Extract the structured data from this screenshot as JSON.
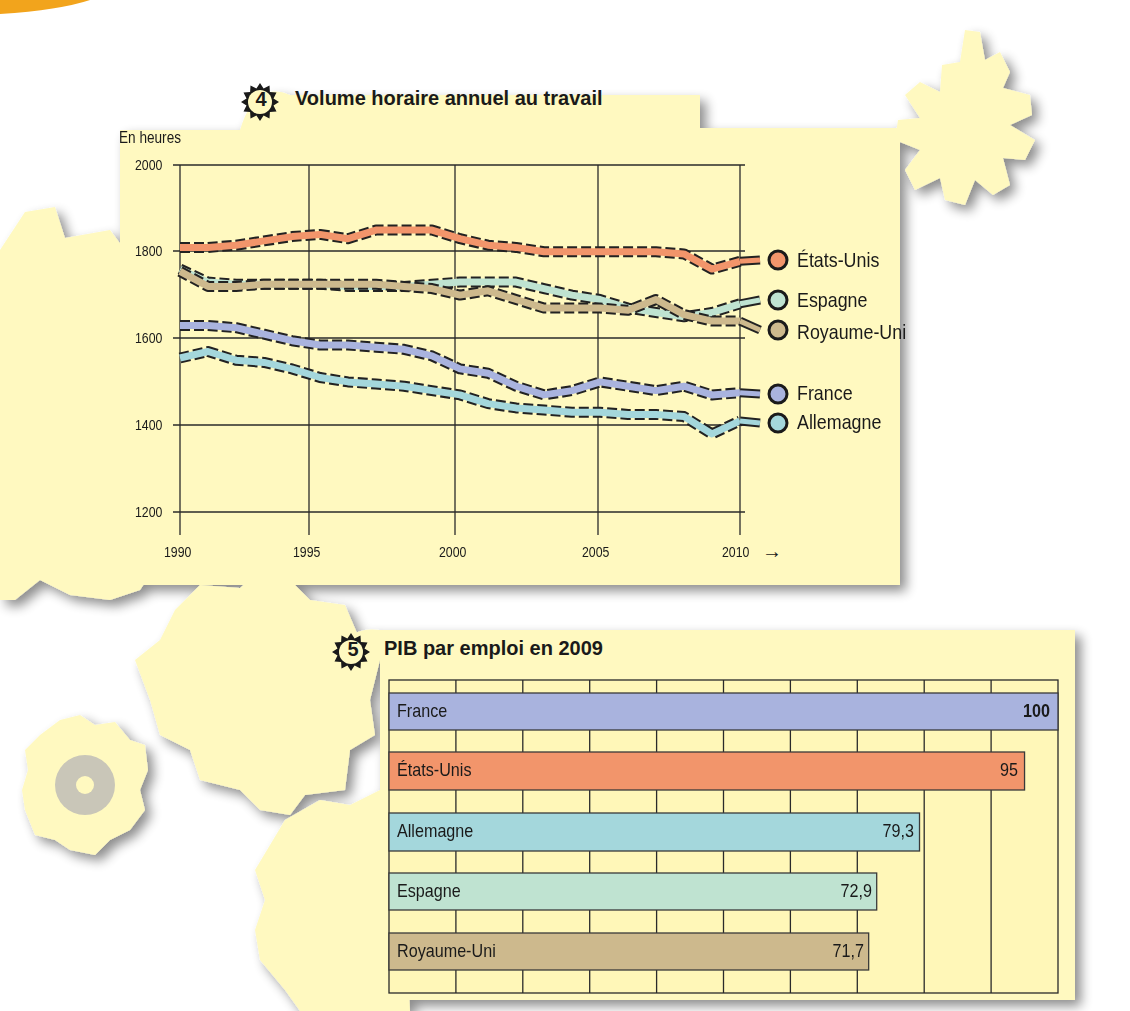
{
  "top_accent_color": "#f2a41c",
  "panel_color": "#fff9c0",
  "chart4": {
    "number": "4",
    "title": "Volume horaire annuel au travail",
    "y_unit_label": "En heures",
    "y_ticks": [
      "2000",
      "1800",
      "1600",
      "1400",
      "1200"
    ],
    "x_ticks": [
      "1990",
      "1995",
      "2000",
      "2005",
      "2010"
    ],
    "x_arrow": "→",
    "legend": [
      {
        "label": "États-Unis",
        "color": "#f2956b"
      },
      {
        "label": "Espagne",
        "color": "#bfe3d1"
      },
      {
        "label": "Royaume-Uni",
        "color": "#cdb98d"
      },
      {
        "label": "France",
        "color": "#a9b3de"
      },
      {
        "label": "Allemagne",
        "color": "#a4d7dc"
      }
    ]
  },
  "chart5": {
    "number": "5",
    "title": "PIB par emploi en 2009",
    "bars": [
      {
        "label": "France",
        "value": "100",
        "color": "#a9b3de"
      },
      {
        "label": "États-Unis",
        "value": "95",
        "color": "#f2956b"
      },
      {
        "label": "Allemagne",
        "value": "79,3",
        "color": "#a4d7dc"
      },
      {
        "label": "Espagne",
        "value": "72,9",
        "color": "#bfe3d1"
      },
      {
        "label": "Royaume-Uni",
        "value": "71,7",
        "color": "#cdb98d"
      }
    ]
  },
  "chart_data": [
    {
      "type": "line",
      "title": "Volume horaire annuel au travail",
      "xlabel": "",
      "ylabel": "En heures",
      "ylim": [
        1200,
        2000
      ],
      "xlim": [
        1990,
        2010
      ],
      "grid": true,
      "legend_position": "right (end-of-line labels)",
      "x": [
        1990,
        1991,
        1992,
        1993,
        1994,
        1995,
        1996,
        1997,
        1998,
        1999,
        2000,
        2001,
        2002,
        2003,
        2004,
        2005,
        2006,
        2007,
        2008,
        2009,
        2010
      ],
      "series": [
        {
          "name": "États-Unis",
          "values": [
            1810,
            1810,
            1815,
            1825,
            1835,
            1840,
            1830,
            1850,
            1850,
            1850,
            1830,
            1815,
            1810,
            1800,
            1800,
            1800,
            1800,
            1800,
            1795,
            1760,
            1778
          ]
        },
        {
          "name": "Espagne",
          "values": [
            1760,
            1730,
            1725,
            1725,
            1725,
            1725,
            1720,
            1720,
            1720,
            1725,
            1730,
            1730,
            1730,
            1715,
            1700,
            1690,
            1670,
            1660,
            1650,
            1660,
            1680
          ]
        },
        {
          "name": "Royaume-Uni",
          "values": [
            1755,
            1720,
            1720,
            1725,
            1725,
            1725,
            1725,
            1725,
            1720,
            1715,
            1700,
            1710,
            1690,
            1670,
            1670,
            1670,
            1665,
            1690,
            1655,
            1640,
            1640
          ]
        },
        {
          "name": "France",
          "values": [
            1630,
            1630,
            1625,
            1610,
            1595,
            1585,
            1585,
            1580,
            1575,
            1560,
            1530,
            1520,
            1490,
            1470,
            1480,
            1500,
            1490,
            1480,
            1490,
            1470,
            1475
          ]
        },
        {
          "name": "Allemagne",
          "values": [
            1555,
            1570,
            1550,
            1545,
            1530,
            1510,
            1500,
            1495,
            1490,
            1480,
            1470,
            1450,
            1440,
            1435,
            1430,
            1430,
            1425,
            1425,
            1420,
            1380,
            1410
          ]
        }
      ]
    },
    {
      "type": "bar",
      "orientation": "horizontal",
      "title": "PIB par emploi en 2009",
      "categories": [
        "France",
        "États-Unis",
        "Allemagne",
        "Espagne",
        "Royaume-Uni"
      ],
      "values": [
        100,
        95,
        79.3,
        72.9,
        71.7
      ],
      "xlim": [
        0,
        100
      ],
      "grid": true,
      "xlabel": "",
      "ylabel": ""
    }
  ]
}
